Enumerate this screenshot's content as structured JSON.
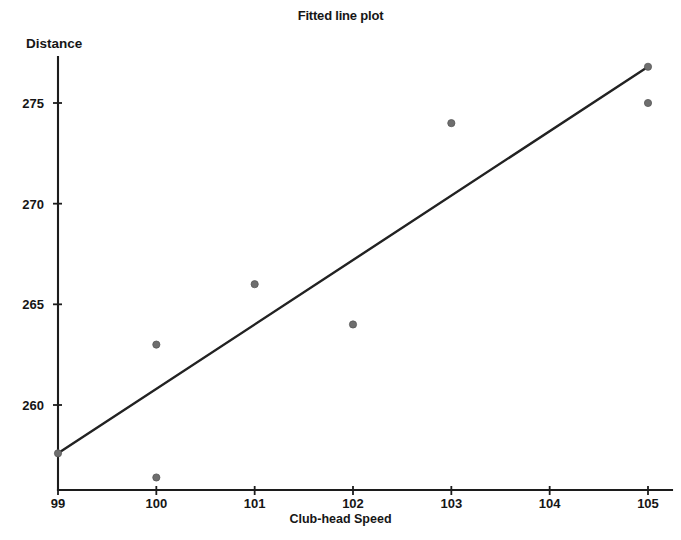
{
  "chart_data": {
    "type": "scatter",
    "title": "Fitted line plot",
    "xlabel": "Club-head Speed",
    "ylabel": "Distance",
    "xlim": [
      98.7,
      105.3
    ],
    "ylim": [
      256.0,
      277.6
    ],
    "xticks": [
      99,
      100,
      101,
      102,
      103,
      104,
      105
    ],
    "xtick_labels": [
      "99",
      "100",
      "101",
      "102",
      "103",
      "104",
      "105"
    ],
    "yticks": [
      260,
      265,
      270,
      275
    ],
    "ytick_labels": [
      "260",
      "265",
      "270",
      "275"
    ],
    "grid": false,
    "legend": false,
    "series": [
      {
        "name": "Observations",
        "marker": "circle",
        "color": "#6e6e6e",
        "x": [
          99,
          100,
          100,
          101,
          102,
          103,
          105,
          105
        ],
        "y": [
          257.6,
          263.0,
          256.4,
          266.0,
          264.0,
          274.0,
          276.8,
          275.0
        ]
      },
      {
        "name": "Fitted line",
        "type": "line",
        "color": "#222222",
        "x": [
          99,
          105
        ],
        "y": [
          257.6,
          276.8
        ]
      }
    ]
  }
}
